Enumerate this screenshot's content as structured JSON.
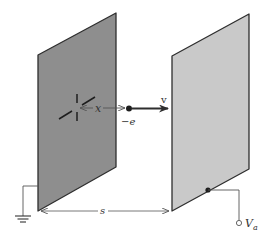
{
  "diagram": {
    "colors": {
      "cathode_fill": "#8e8e8e",
      "anode_fill": "#c9c9c9",
      "edge": "#2e2e2e",
      "wire": "#555555",
      "text": "#333333"
    },
    "cathode_plate": {
      "points": "38,55 116,13 116,167 38,211"
    },
    "anode_plate": {
      "points": "172,56 249,14 249,169 172,211"
    },
    "labels": {
      "position": "x",
      "velocity": "v",
      "charge": "−e",
      "separation": "s",
      "anode_voltage_main": "V",
      "anode_voltage_sub": "a"
    }
  }
}
